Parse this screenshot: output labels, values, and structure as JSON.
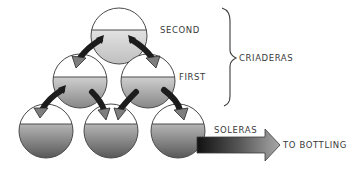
{
  "diagram": {
    "tiers": [
      {
        "id": "second",
        "label": "SECOND",
        "group": "criaderas"
      },
      {
        "id": "first",
        "label": "FIRST",
        "group": "criaderas"
      },
      {
        "id": "soleras",
        "label": "SOLERAS",
        "group": "soleras"
      }
    ],
    "group_label": "CRIADERAS",
    "output_label": "TO BOTTLING",
    "colors": {
      "barrel_outline": "#4a4a4a",
      "liquid_light": "#d4d4d4",
      "liquid_dark": "#5a5a5a",
      "arrow_dark": "#1e1e1e",
      "arrow_light": "#8a8a8a",
      "text": "#3a3a3a"
    }
  }
}
